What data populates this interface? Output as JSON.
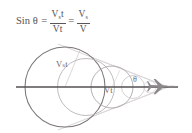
{
  "figure": {
    "formula": {
      "lhs": "Sin θ",
      "equals_1": "=",
      "fraction_1": {
        "numerator_base": "V",
        "numerator_sub": "s",
        "numerator_suffix": "t",
        "denominator": "Vt"
      },
      "equals_2": "=",
      "fraction_2": {
        "numerator_base": "V",
        "numerator_sub": "s",
        "numerator_suffix": "",
        "denominator": "V"
      },
      "plain_text": "Sin θ = Vst / Vt = Vs / V"
    },
    "labels": {
      "wavefront_large": "Vₛt",
      "wavefront_small": "Vt",
      "angle": "θ"
    },
    "colors": {
      "background": "#ffffff",
      "axis_line": "#555053",
      "circle_stroke_dark": "#7b7679",
      "circle_stroke_light": "#bdb8bb",
      "cone_line": "#cac5c8",
      "text": "#555153",
      "aircraft": "#8d888b"
    },
    "elements": {
      "flight_path_label": "horizontal flight path",
      "aircraft_label": "supersonic aircraft",
      "cone_label": "mach cone"
    }
  }
}
